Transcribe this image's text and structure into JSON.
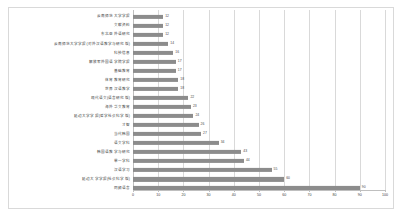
{
  "chart_data": {
    "type": "bar",
    "orientation": "horizontal",
    "title": "",
    "xlabel": "",
    "ylabel": "",
    "xlim": [
      0,
      100
    ],
    "grid": true,
    "legend": false,
    "xticks": [
      "0",
      "10",
      "20",
      "30",
      "40",
      "50",
      "60",
      "70",
      "80",
      "90",
      "100"
    ],
    "bar_color": "#8c8c8c",
    "categories": [
      "云南师范大学学报",
      "文献资料",
      "东北亚外语研究",
      "云南师范大学学报(对外汉语教学与研究版)",
      "科技信息",
      "解放军外国语学院学报",
      "基础教育",
      "体育教育研究",
      "世界汉语教学",
      "现代语文(语言研究版)",
      "海外华文教育",
      "延边大学学报(哲学社会科学版)",
      "才智",
      "当代韩国",
      "语文学科",
      "韩国语教学与研究",
      "单一学科",
      "汉语学习",
      "延边大学学报(社会科学版)",
      "同频语言"
    ],
    "values": [
      12,
      12,
      12,
      14,
      16,
      17,
      17,
      18,
      18,
      22,
      23,
      24,
      26,
      27,
      34,
      43,
      44,
      55,
      60,
      90
    ]
  }
}
